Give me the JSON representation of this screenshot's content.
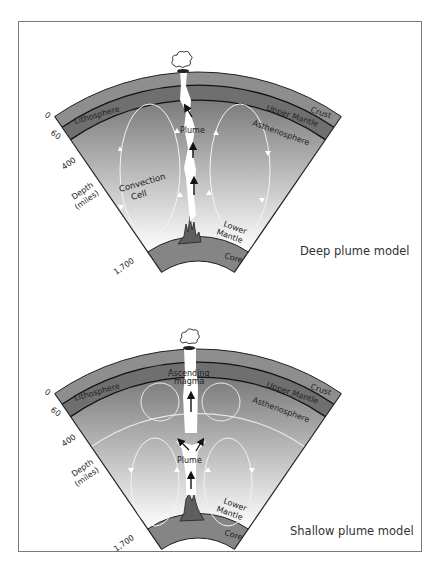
{
  "diagrams": [
    {
      "caption": "Deep plume model",
      "layers": {
        "crust": "Crust",
        "upper_mantle": "Upper Mantle",
        "lithosphere": "Lithosphere",
        "asthenosphere": "Asthenosphere",
        "lower_mantle_1": "Lower",
        "lower_mantle_2": "Mantle",
        "core": "Core"
      },
      "labels": {
        "plume": "Plume",
        "convection_1": "Convection",
        "convection_2": "Cell"
      },
      "depth_axis": {
        "ticks": [
          "0",
          "60",
          "400",
          "1,700"
        ],
        "title_1": "Depth",
        "title_2": "(miles)"
      }
    },
    {
      "caption": "Shallow plume model",
      "layers": {
        "crust": "Crust",
        "upper_mantle": "Upper Mantle",
        "lithosphere": "Lithosphere",
        "asthenosphere": "Asthenosphere",
        "lower_mantle_1": "Lower",
        "lower_mantle_2": "Mantle",
        "core": "Core"
      },
      "labels": {
        "plume": "Plume",
        "ascending_1": "Ascending",
        "ascending_2": "magma"
      },
      "depth_axis": {
        "ticks": [
          "0",
          "60",
          "400",
          "1,700"
        ],
        "title_1": "Depth",
        "title_2": "(miles)"
      }
    }
  ],
  "colors": {
    "crust": "#8e8e8e",
    "upper_band": "#6f6f6f",
    "mantle_top": "#7c7c7c",
    "mantle_bottom": "#ffffff",
    "core": "#858585",
    "outline": "#222222"
  }
}
